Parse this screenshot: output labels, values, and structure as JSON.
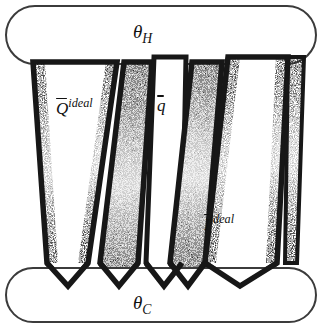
{
  "figure": {
    "background_color": "#ffffff",
    "stroke_color": "#1a1a1a",
    "fill_texture_color": "#2b2b2b",
    "reservoirs": {
      "hot": {
        "name": "hot-reservoir",
        "label_base": "θ",
        "label_sub": "H",
        "shape": "stadium",
        "x": 6,
        "y": 6,
        "width": 310,
        "height": 58,
        "radius": 29
      },
      "cold": {
        "name": "cold-reservoir",
        "label_base": "θ",
        "label_sub": "C",
        "shape": "stadium",
        "x": 6,
        "y": 268,
        "width": 310,
        "height": 54,
        "radius": 27
      }
    },
    "arrows": [
      {
        "id": "arrow-q-ideal-left",
        "label_base": "Q",
        "label_sup": "ideal",
        "overbar": true,
        "top_left": 33,
        "top_right": 117,
        "bottom_left": 47,
        "bottom_right": 88,
        "top_y": 62,
        "body_bottom_y": 263,
        "tip_y": 286,
        "direction": "down"
      },
      {
        "id": "arrow-q-ideal-return",
        "label_base": "",
        "label_sup": "",
        "overbar": false,
        "top_left": 124,
        "top_right": 152,
        "bottom_left": 100,
        "bottom_right": 138,
        "top_y": 62,
        "body_bottom_y": 263,
        "tip_y": 286,
        "direction": "down"
      },
      {
        "id": "arrow-q-small",
        "label_base": "q",
        "label_sup": "",
        "overbar": true,
        "top_left": 154,
        "top_right": 186,
        "bottom_left": 146,
        "bottom_right": 182,
        "top_y": 57,
        "body_bottom_y": 263,
        "tip_y": 286,
        "direction": "down"
      },
      {
        "id": "arrow-i-ideal",
        "label_base": "I",
        "label_sup": "ideal",
        "overbar": true,
        "top_left": 192,
        "top_right": 288,
        "bottom_left": 190,
        "bottom_right": 285,
        "top_y": 57,
        "body_bottom_y": 263,
        "tip_y": 286,
        "direction": "down"
      }
    ],
    "labels": {
      "hot": "θH",
      "cold": "θC",
      "heat_ideal": "Qideal",
      "heat_small": "q",
      "current_ideal": "Iideal"
    }
  }
}
